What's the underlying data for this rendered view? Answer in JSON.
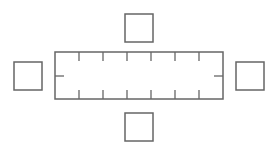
{
  "diagram": {
    "stroke_color": "#666666",
    "background": "#ffffff",
    "table": {
      "x": 55,
      "y": 52,
      "width": 168,
      "height": 47
    },
    "table_ticks_x": [
      79,
      103,
      127,
      151,
      175,
      199
    ],
    "tick_length": 9,
    "side_ticks": {
      "left_x": 55,
      "right_x": 223,
      "y": 76,
      "length": 9
    },
    "chairs": [
      {
        "position": "top",
        "x": 125,
        "y": 14,
        "size": 28
      },
      {
        "position": "bottom",
        "x": 125,
        "y": 113,
        "size": 28
      },
      {
        "position": "left",
        "x": 14,
        "y": 62,
        "size": 28
      },
      {
        "position": "right",
        "x": 236,
        "y": 62,
        "size": 28
      }
    ]
  }
}
